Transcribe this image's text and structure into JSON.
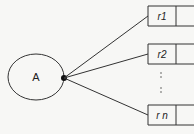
{
  "diagram": {
    "source_node": {
      "label": "A"
    },
    "records": [
      {
        "label": "r1"
      },
      {
        "label": "r2"
      },
      {
        "label": "r n"
      }
    ],
    "ellipsis": ":\n:",
    "colors": {
      "stroke": "#333333",
      "background": "#f7f7f5"
    }
  }
}
